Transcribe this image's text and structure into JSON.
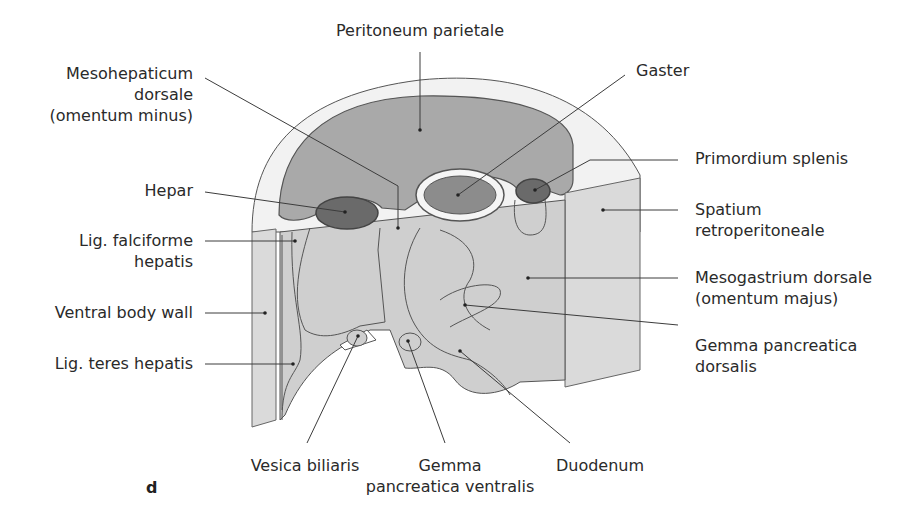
{
  "figure": {
    "panel_letter": "d",
    "colors": {
      "outer_wall": "#f2f2f2",
      "peritoneal_cavity": "#a9a9a9",
      "membrane": "#e6e6e6",
      "mesentery": "#cfcfcf",
      "retroperitoneal": "#dadada",
      "organ_dark": "#6a6a6a",
      "stomach": "#8c8c8c",
      "line": "#3c3c3c"
    }
  },
  "labels": {
    "peritoneum_parietale": "Peritoneum parietale",
    "mesohepaticum_line1": "Mesohepaticum",
    "mesohepaticum_line2": "dorsale",
    "mesohepaticum_line3": "(omentum minus)",
    "gaster": "Gaster",
    "hepar": "Hepar",
    "primordium_splenis": "Primordium splenis",
    "lig_falciforme_line1": "Lig. falciforme",
    "lig_falciforme_line2": "hepatis",
    "spatium_line1": "Spatium",
    "spatium_line2": "retroperitoneale",
    "ventral_body_wall": "Ventral body wall",
    "mesogastrium_line1": "Mesogastrium dorsale",
    "mesogastrium_line2": "(omentum majus)",
    "lig_teres_hepatis": "Lig. teres hepatis",
    "gemma_dorsalis_line1": "Gemma pancreatica",
    "gemma_dorsalis_line2": "dorsalis",
    "vesica_biliaris": "Vesica biliaris",
    "gemma_ventralis_line1": "Gemma",
    "gemma_ventralis_line2": "pancreatica ventralis",
    "duodenum": "Duodenum"
  }
}
